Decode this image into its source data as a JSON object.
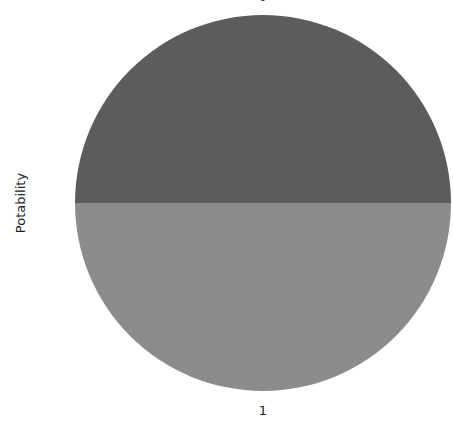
{
  "chart_data": {
    "type": "pie",
    "title": "",
    "ylabel": "Potability",
    "categories": [
      "0",
      "1"
    ],
    "values": [
      50,
      50
    ],
    "colors": [
      "#5c5c5c",
      "#8c8c8c"
    ],
    "start_angle_deg": 0,
    "legend": null
  },
  "labels": {
    "ylabel": "Potability",
    "slice0": "0",
    "slice1": "1"
  }
}
